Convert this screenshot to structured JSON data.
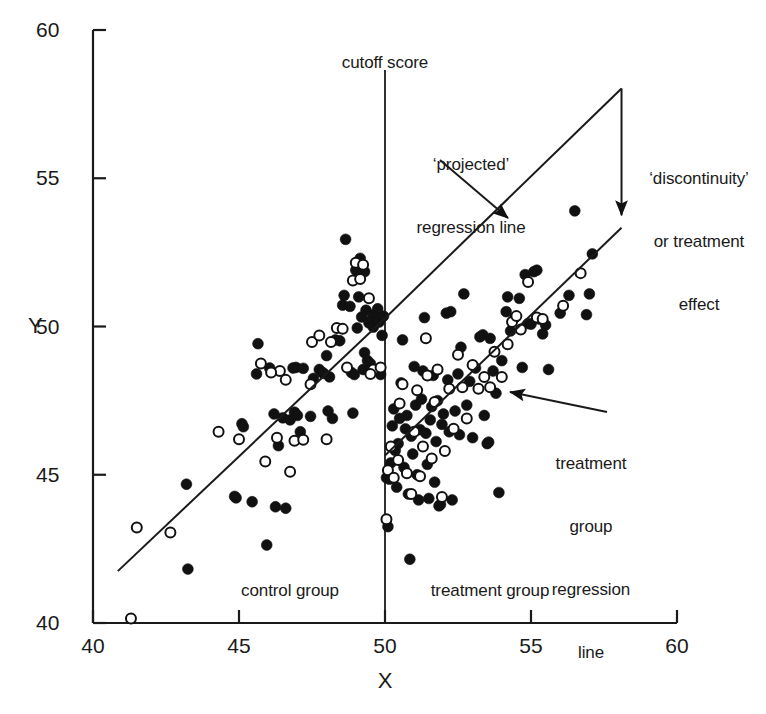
{
  "chart_data": {
    "type": "scatter",
    "title": "",
    "xlabel": "X",
    "ylabel": "Y",
    "xlim": [
      40,
      60
    ],
    "ylim": [
      40,
      60
    ],
    "xticks": [
      "40",
      "45",
      "50",
      "55",
      "60"
    ],
    "yticks": [
      "40",
      "45",
      "50",
      "55",
      "60"
    ],
    "grid": false,
    "legend": "none",
    "cutoff": 50,
    "annotations": {
      "cutoff_label": "cutoff score",
      "projected_line_label_line1": "‘projected’",
      "projected_line_label_line2": "regression line",
      "discontinuity_label_line1": "‘discontinuity’",
      "discontinuity_label_line2": "or treatment",
      "discontinuity_label_line3": "effect",
      "treatment_line_label_line1": "treatment",
      "treatment_line_label_line2": "group",
      "treatment_line_label_line3": "regression",
      "treatment_line_label_line4": "line",
      "control_group_label": "control group",
      "treatment_group_label": "treatment group"
    },
    "lines": [
      {
        "name": "control-regression-line",
        "x": [
          40.85,
          50.0
        ],
        "y": [
          41.75,
          50.28
        ]
      },
      {
        "name": "projected-regression-line",
        "x": [
          50.0,
          58.1
        ],
        "y": [
          50.28,
          58.03
        ]
      },
      {
        "name": "treatment-regression-line",
        "x": [
          50.0,
          58.1
        ],
        "y": [
          45.65,
          53.33
        ]
      }
    ],
    "series": [
      {
        "name": "control-group-filled",
        "marker": "filled-circle",
        "color": "#111111",
        "points": [
          [
            43.2,
            44.68
          ],
          [
            43.25,
            41.82
          ],
          [
            44.85,
            44.27
          ],
          [
            45.1,
            46.72
          ],
          [
            45.15,
            46.62
          ],
          [
            45.6,
            48.4
          ],
          [
            45.65,
            49.42
          ],
          [
            45.45,
            44.09
          ],
          [
            45.95,
            42.63
          ],
          [
            46.25,
            43.92
          ],
          [
            46.6,
            43.87
          ],
          [
            46.35,
            45.98
          ],
          [
            46.5,
            46.92
          ],
          [
            46.75,
            46.85
          ],
          [
            46.9,
            47.11
          ],
          [
            46.95,
            48.62
          ],
          [
            46.85,
            48.6
          ],
          [
            47.1,
            46.45
          ],
          [
            47.2,
            48.59
          ],
          [
            47.45,
            46.97
          ],
          [
            47.55,
            48.25
          ],
          [
            47.75,
            48.55
          ],
          [
            47.85,
            48.45
          ],
          [
            47.9,
            48.42
          ],
          [
            48.05,
            47.15
          ],
          [
            48.1,
            48.3
          ],
          [
            48.0,
            49.02
          ],
          [
            48.3,
            49.55
          ],
          [
            48.45,
            49.52
          ],
          [
            48.55,
            50.72
          ],
          [
            48.6,
            51.05
          ],
          [
            48.65,
            52.94
          ],
          [
            48.8,
            50.68
          ],
          [
            48.85,
            48.45
          ],
          [
            48.9,
            47.08
          ],
          [
            48.95,
            48.38
          ],
          [
            49.05,
            49.95
          ],
          [
            49.1,
            51.0
          ],
          [
            49.15,
            52.3
          ],
          [
            49.2,
            50.32
          ],
          [
            49.25,
            48.55
          ],
          [
            49.3,
            49.12
          ],
          [
            49.35,
            50.55
          ],
          [
            49.4,
            48.85
          ],
          [
            49.45,
            50.12
          ],
          [
            49.5,
            48.75
          ],
          [
            49.55,
            50.25
          ],
          [
            49.6,
            49.98
          ],
          [
            49.65,
            50.42
          ],
          [
            49.7,
            48.52
          ],
          [
            49.75,
            50.6
          ],
          [
            49.8,
            50.15
          ],
          [
            49.85,
            48.38
          ],
          [
            49.9,
            49.7
          ],
          [
            49.95,
            50.35
          ],
          [
            44.9,
            44.22
          ],
          [
            46.2,
            47.05
          ],
          [
            47.0,
            47.0
          ],
          [
            48.2,
            46.9
          ],
          [
            46.05,
            48.6
          ],
          [
            49.0,
            51.9
          ],
          [
            49.3,
            51.85
          ]
        ]
      },
      {
        "name": "control-group-open",
        "marker": "open-circle",
        "color": "#111111",
        "points": [
          [
            41.3,
            40.15
          ],
          [
            41.5,
            43.22
          ],
          [
            42.65,
            43.05
          ],
          [
            44.3,
            46.45
          ],
          [
            45.0,
            46.2
          ],
          [
            45.9,
            45.45
          ],
          [
            46.3,
            46.25
          ],
          [
            46.6,
            48.2
          ],
          [
            46.4,
            48.5
          ],
          [
            46.75,
            45.1
          ],
          [
            46.9,
            46.15
          ],
          [
            47.2,
            46.18
          ],
          [
            47.45,
            48.05
          ],
          [
            47.5,
            49.48
          ],
          [
            48.0,
            46.2
          ],
          [
            48.15,
            49.48
          ],
          [
            48.35,
            49.95
          ],
          [
            48.55,
            49.92
          ],
          [
            48.9,
            51.55
          ],
          [
            49.0,
            52.15
          ],
          [
            49.15,
            51.6
          ],
          [
            49.25,
            52.08
          ],
          [
            49.45,
            50.95
          ],
          [
            49.6,
            48.55
          ],
          [
            49.85,
            48.62
          ],
          [
            46.1,
            48.45
          ],
          [
            47.75,
            49.7
          ],
          [
            48.7,
            48.62
          ],
          [
            49.5,
            48.4
          ],
          [
            45.75,
            48.75
          ]
        ]
      },
      {
        "name": "treatment-group-filled",
        "marker": "filled-circle",
        "color": "#111111",
        "points": [
          [
            50.1,
            43.25
          ],
          [
            50.15,
            44.85
          ],
          [
            50.2,
            45.4
          ],
          [
            50.25,
            46.65
          ],
          [
            50.3,
            47.22
          ],
          [
            50.35,
            45.82
          ],
          [
            50.4,
            44.58
          ],
          [
            50.45,
            46.05
          ],
          [
            50.5,
            46.9
          ],
          [
            50.55,
            48.1
          ],
          [
            50.6,
            49.55
          ],
          [
            50.65,
            45.25
          ],
          [
            50.7,
            46.55
          ],
          [
            50.75,
            47.0
          ],
          [
            50.8,
            44.35
          ],
          [
            50.85,
            42.15
          ],
          [
            50.9,
            46.3
          ],
          [
            50.95,
            45.7
          ],
          [
            51.0,
            48.65
          ],
          [
            51.05,
            47.35
          ],
          [
            51.1,
            45.0
          ],
          [
            51.15,
            44.15
          ],
          [
            51.2,
            46.52
          ],
          [
            51.25,
            47.55
          ],
          [
            51.3,
            48.5
          ],
          [
            51.35,
            50.3
          ],
          [
            51.4,
            46.4
          ],
          [
            51.45,
            45.35
          ],
          [
            51.5,
            44.2
          ],
          [
            51.55,
            46.85
          ],
          [
            51.6,
            47.3
          ],
          [
            51.65,
            48.35
          ],
          [
            51.7,
            44.75
          ],
          [
            51.75,
            46.12
          ],
          [
            51.8,
            47.5
          ],
          [
            51.85,
            43.95
          ],
          [
            51.9,
            44.0
          ],
          [
            51.95,
            46.7
          ],
          [
            52.0,
            47.05
          ],
          [
            52.1,
            50.45
          ],
          [
            52.15,
            48.2
          ],
          [
            52.2,
            46.45
          ],
          [
            52.3,
            44.15
          ],
          [
            52.4,
            47.15
          ],
          [
            52.5,
            48.4
          ],
          [
            52.55,
            46.35
          ],
          [
            52.6,
            49.3
          ],
          [
            52.7,
            51.1
          ],
          [
            52.8,
            47.35
          ],
          [
            52.9,
            48.15
          ],
          [
            53.0,
            46.25
          ],
          [
            53.1,
            48.6
          ],
          [
            53.25,
            49.65
          ],
          [
            53.35,
            49.72
          ],
          [
            53.4,
            47.0
          ],
          [
            53.5,
            46.05
          ],
          [
            53.55,
            46.1
          ],
          [
            53.7,
            48.5
          ],
          [
            53.8,
            47.75
          ],
          [
            53.9,
            44.4
          ],
          [
            54.0,
            48.85
          ],
          [
            54.15,
            50.5
          ],
          [
            54.2,
            51.0
          ],
          [
            54.3,
            49.85
          ],
          [
            54.45,
            50.3
          ],
          [
            54.6,
            50.95
          ],
          [
            54.7,
            48.62
          ],
          [
            54.8,
            51.75
          ],
          [
            54.9,
            50.1
          ],
          [
            55.0,
            50.08
          ],
          [
            55.1,
            51.85
          ],
          [
            55.2,
            51.9
          ],
          [
            55.3,
            50.25
          ],
          [
            55.4,
            49.75
          ],
          [
            55.5,
            50.05
          ],
          [
            55.6,
            48.55
          ],
          [
            56.0,
            50.45
          ],
          [
            56.3,
            51.05
          ],
          [
            56.5,
            53.9
          ],
          [
            56.9,
            50.4
          ],
          [
            57.0,
            51.1
          ],
          [
            57.1,
            52.45
          ],
          [
            52.25,
            50.5
          ],
          [
            53.6,
            49.6
          ],
          [
            50.05,
            44.9
          ]
        ]
      },
      {
        "name": "treatment-group-open",
        "marker": "open-circle",
        "color": "#111111",
        "points": [
          [
            50.05,
            43.5
          ],
          [
            50.1,
            45.15
          ],
          [
            50.2,
            45.95
          ],
          [
            50.3,
            44.9
          ],
          [
            50.45,
            45.5
          ],
          [
            50.5,
            47.4
          ],
          [
            50.6,
            48.05
          ],
          [
            50.75,
            45.05
          ],
          [
            50.9,
            44.35
          ],
          [
            51.0,
            46.45
          ],
          [
            51.1,
            47.85
          ],
          [
            51.2,
            44.95
          ],
          [
            51.3,
            45.95
          ],
          [
            51.45,
            48.35
          ],
          [
            51.6,
            45.55
          ],
          [
            51.7,
            47.45
          ],
          [
            51.8,
            48.55
          ],
          [
            51.95,
            44.25
          ],
          [
            52.05,
            45.8
          ],
          [
            52.2,
            47.9
          ],
          [
            52.35,
            46.55
          ],
          [
            52.5,
            49.05
          ],
          [
            52.65,
            47.95
          ],
          [
            52.8,
            46.9
          ],
          [
            53.0,
            48.7
          ],
          [
            53.2,
            47.9
          ],
          [
            53.4,
            48.3
          ],
          [
            53.6,
            47.95
          ],
          [
            53.75,
            49.15
          ],
          [
            54.0,
            48.3
          ],
          [
            54.2,
            49.4
          ],
          [
            54.35,
            50.15
          ],
          [
            54.5,
            50.35
          ],
          [
            54.65,
            49.9
          ],
          [
            54.9,
            51.5
          ],
          [
            55.2,
            50.3
          ],
          [
            55.4,
            50.25
          ],
          [
            56.1,
            50.7
          ],
          [
            56.7,
            51.8
          ],
          [
            51.4,
            49.6
          ]
        ]
      }
    ]
  }
}
